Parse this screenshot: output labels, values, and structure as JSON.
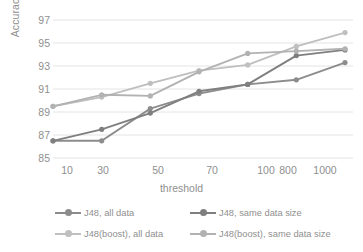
{
  "chart_data": {
    "type": "line",
    "title": "",
    "xlabel": "threshold",
    "ylabel": "Accuracy(%)",
    "categories": [
      "10",
      "30",
      "50",
      "70",
      "100",
      "800",
      "1000"
    ],
    "ylim": [
      85,
      97
    ],
    "yticks": [
      "85",
      "87",
      "89",
      "91",
      "93",
      "95",
      "97"
    ],
    "grid": "horizontal",
    "legend_position": "bottom",
    "series": [
      {
        "name": "J48, all data",
        "color": "#8c8c8c",
        "values": [
          86.5,
          86.5,
          89.3,
          90.6,
          91.4,
          91.8,
          93.3
        ]
      },
      {
        "name": "J48, same data size",
        "color": "#7f7f7f",
        "values": [
          86.5,
          87.5,
          88.9,
          90.8,
          91.4,
          93.9,
          94.4
        ]
      },
      {
        "name": "J48(boost), all data",
        "color": "#bfbfbf",
        "values": [
          89.5,
          90.3,
          91.5,
          92.6,
          93.1,
          94.7,
          95.9
        ]
      },
      {
        "name": "J48(boost), same data size",
        "color": "#b2b2b2",
        "values": [
          89.5,
          90.5,
          90.4,
          92.5,
          94.1,
          94.3,
          94.5
        ]
      }
    ]
  },
  "axis": {
    "y_title": "Accuracy(%)",
    "x_title": "threshold"
  },
  "colors": {
    "gridline": "#e4e4e4",
    "axis_text": "#8f8f8f",
    "background": "#ffffff"
  }
}
